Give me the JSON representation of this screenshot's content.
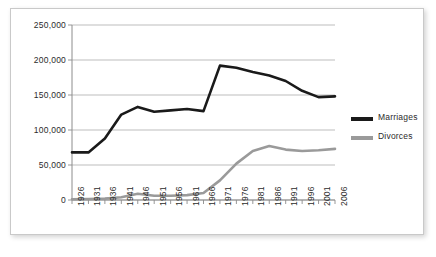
{
  "chart_data": {
    "type": "line",
    "title": "",
    "subtitle": "",
    "xlabel": "",
    "ylabel": "",
    "x": [
      1926,
      1931,
      1936,
      1941,
      1946,
      1951,
      1956,
      1961,
      1966,
      1971,
      1976,
      1981,
      1986,
      1991,
      1996,
      2001,
      2006
    ],
    "xtick_labels": [
      "1926",
      "1931",
      "1936",
      "1941",
      "1946",
      "1951",
      "1956",
      "1961",
      "1966",
      "1971",
      "1976",
      "1981",
      "1986",
      "1991",
      "1996",
      "2001",
      "2006"
    ],
    "ytick_labels": [
      "0",
      "50,000",
      "100,000",
      "150,000",
      "200,000",
      "250,000"
    ],
    "ytick_values": [
      0,
      50000,
      100000,
      150000,
      200000,
      250000
    ],
    "ylim": [
      0,
      250000
    ],
    "grid": true,
    "grid_axis": "y",
    "legend_position": "right",
    "series": [
      {
        "name": "Marriages",
        "color": "#1a1a1a",
        "values": [
          68000,
          68000,
          88000,
          122000,
          133000,
          126000,
          128000,
          130000,
          127000,
          192000,
          189000,
          183000,
          178000,
          170000,
          156000,
          147000,
          148000
        ]
      },
      {
        "name": "Divorces",
        "color": "#9a9a9a",
        "values": [
          1000,
          1500,
          2000,
          4000,
          9000,
          6000,
          6000,
          7000,
          10000,
          28000,
          52000,
          70000,
          77000,
          72000,
          70000,
          71000,
          73000
        ]
      }
    ]
  },
  "legend": {
    "entries": [
      {
        "label": "Marriages",
        "color": "#1a1a1a"
      },
      {
        "label": "Divorces",
        "color": "#9a9a9a"
      }
    ]
  },
  "axes": {
    "y_labels": [
      "250,000",
      "200,000",
      "150,000",
      "100,000",
      "50,000",
      "0"
    ],
    "x_labels": [
      "1926",
      "1931",
      "1936",
      "1941",
      "1946",
      "1951",
      "1956",
      "1961",
      "1966",
      "1971",
      "1976",
      "1981",
      "1986",
      "1991",
      "1996",
      "2001",
      "2006"
    ]
  },
  "style": {
    "axis_color": "#8c8c8c",
    "grid_color": "#b5b5b5",
    "frame_color": "#c9c9c9",
    "text_color": "#2b2b2b",
    "background": "#ffffff"
  }
}
